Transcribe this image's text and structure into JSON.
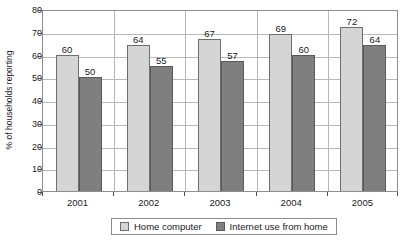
{
  "chart_data": {
    "type": "bar",
    "title": "",
    "subtitle": "",
    "xlabel": "",
    "ylabel": "% of households reporting",
    "categories": [
      "2001",
      "2002",
      "2003",
      "2004",
      "2005"
    ],
    "series": [
      {
        "name": "Home computer",
        "values": [
          60,
          64,
          67,
          69,
          72
        ],
        "color": "#d5d5d5"
      },
      {
        "name": "Internet use from home",
        "values": [
          50,
          55,
          57,
          60,
          64
        ],
        "color": "#7f7f7f"
      }
    ],
    "ylim": [
      0,
      80
    ],
    "yticks": [
      0,
      10,
      20,
      30,
      40,
      50,
      60,
      70,
      80
    ],
    "ytick_labels": [
      "0",
      "10",
      "20",
      "30",
      "40",
      "50",
      "60",
      "70",
      "80"
    ],
    "grid": true,
    "grid_axis": "y",
    "legend_position": "bottom",
    "data_labels": true,
    "data_label_values": [
      [
        "60",
        "50"
      ],
      [
        "64",
        "55"
      ],
      [
        "67",
        "57"
      ],
      [
        "69",
        "60"
      ],
      [
        "72",
        "64"
      ]
    ]
  },
  "axes": {
    "y_title": "% of households reporting"
  },
  "legend": {
    "items": [
      {
        "label": "Home computer",
        "swatch": "light"
      },
      {
        "label": "Internet use from home",
        "swatch": "dark"
      }
    ]
  }
}
